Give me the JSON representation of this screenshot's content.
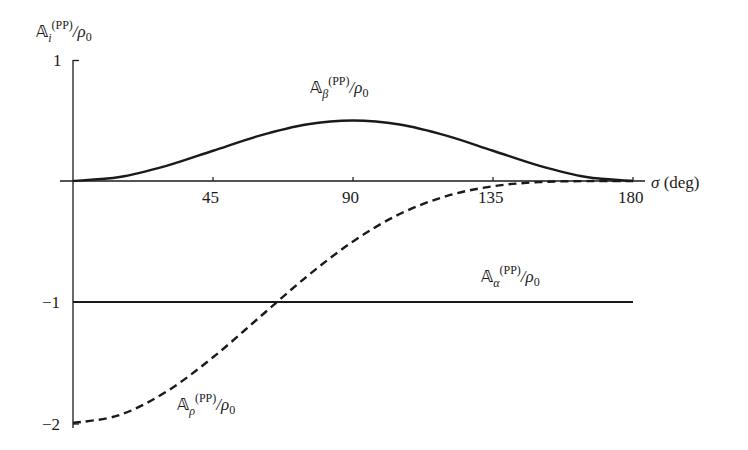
{
  "chart_data": {
    "type": "line",
    "title": "",
    "xlabel": "σ (deg)",
    "ylabel": "𝔸_i^(PP)/ρ_0",
    "xlim": [
      0,
      180
    ],
    "ylim": [
      -2,
      1
    ],
    "x_ticks": [
      "45",
      "90",
      "135",
      "180"
    ],
    "y_ticks": [
      "1",
      "−1",
      "−2"
    ],
    "grid": false,
    "legend": "inline labels",
    "x": [
      0,
      15,
      30,
      45,
      60,
      75,
      90,
      105,
      120,
      135,
      150,
      165,
      180
    ],
    "series": [
      {
        "name": "𝔸_β^(PP)/ρ_0",
        "style": "solid",
        "values": [
          0,
          0.033,
          0.125,
          0.25,
          0.375,
          0.467,
          0.5,
          0.467,
          0.375,
          0.25,
          0.125,
          0.033,
          0
        ]
      },
      {
        "name": "𝔸_α^(PP)/ρ_0",
        "style": "solid",
        "values": [
          -1,
          -1,
          -1,
          -1,
          -1,
          -1,
          -1,
          -1,
          -1,
          -1,
          -1,
          -1,
          -1
        ]
      },
      {
        "name": "𝔸_ρ^(PP)/ρ_0",
        "style": "dashed",
        "values": [
          -2,
          -1.934,
          -1.741,
          -1.457,
          -1.125,
          -0.793,
          -0.5,
          -0.273,
          -0.125,
          -0.043,
          -0.009,
          -0.001,
          0
        ]
      }
    ]
  },
  "labels": {
    "yaxis": {
      "main": "𝔸",
      "sub": "i",
      "sup": "(PP)",
      "rest": "/ρ",
      "rest_sub": "0"
    },
    "xaxis": {
      "sym": "σ",
      "unit": " (deg)"
    },
    "beta": {
      "main": "𝔸",
      "sub": "β",
      "sup": "(PP)",
      "rest": "/ρ",
      "rest_sub": "0"
    },
    "alpha": {
      "main": "𝔸",
      "sub": "α",
      "sup": "(PP)",
      "rest": "/ρ",
      "rest_sub": "0"
    },
    "rho": {
      "main": "𝔸",
      "sub": "ρ",
      "sup": "(PP)",
      "rest": "/ρ",
      "rest_sub": "0"
    }
  },
  "ticks": {
    "x": [
      "45",
      "90",
      "135",
      "180"
    ],
    "y1": "1",
    "ym1": "−1",
    "ym2": "−2"
  }
}
